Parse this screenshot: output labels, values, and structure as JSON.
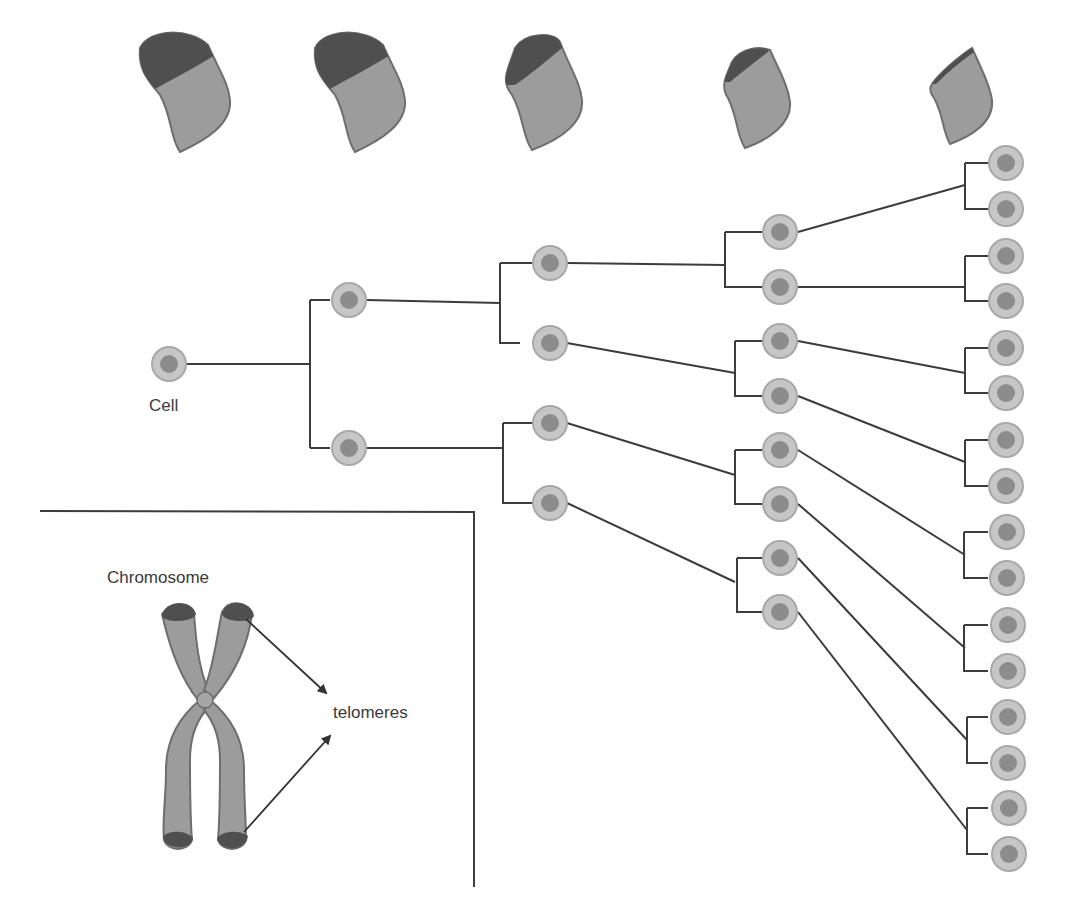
{
  "labels": {
    "cell": "Cell",
    "chromosome": "Chromosome",
    "telomeres": "telomeres"
  },
  "colors": {
    "line": "#3c3c3c",
    "cell_ring": "#c6c6c6",
    "cell_ring_stroke": "#a8a8a8",
    "cell_nucleus": "#8c8c8c",
    "chromatid_body": "#9c9c9c",
    "chromatid_stroke": "#6e6e6e",
    "telomere_cap": "#4f4f4f",
    "text": "#3a3a3a"
  },
  "generations": [
    {
      "level": 0,
      "cells": 1
    },
    {
      "level": 1,
      "cells": 2
    },
    {
      "level": 2,
      "cells": 4
    },
    {
      "level": 3,
      "cells": 8
    },
    {
      "level": 4,
      "cells": 16
    }
  ],
  "top_chromosome_arms": [
    {
      "index": 1,
      "telomere_length": "long"
    },
    {
      "index": 2,
      "telomere_length": "long"
    },
    {
      "index": 3,
      "telomere_length": "medium"
    },
    {
      "index": 4,
      "telomere_length": "short"
    },
    {
      "index": 5,
      "telomere_length": "very short"
    }
  ]
}
